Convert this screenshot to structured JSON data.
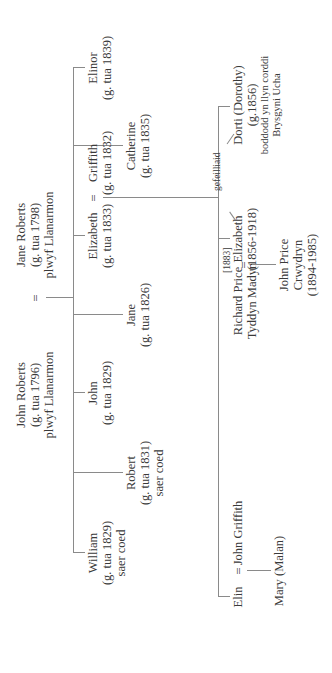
{
  "diagram": {
    "type": "family-tree",
    "orientation": "rotated-90-ccw",
    "marriage_symbol": "=",
    "line_color": "#8a8a8a",
    "text_color": "#3a3a3a"
  },
  "parents": {
    "father": {
      "name": "John Roberts",
      "born": "(g. tua 1796)",
      "place": "plwyf Llanarmon"
    },
    "mother": {
      "name": "Jane Roberts",
      "born": "(g. tua 1798)",
      "place": "plwyf Llanarmon"
    }
  },
  "children": [
    {
      "name": "William",
      "born": "(g. tua 1829)",
      "note": "saer coed"
    },
    {
      "name": "Robert",
      "born": "(g. tua 1831)",
      "note": "saer coed"
    },
    {
      "name": "John",
      "born": "(g. tua 1829)"
    },
    {
      "name": "Jane",
      "born": "(g. tua 1826)"
    },
    {
      "name": "Elizabeth",
      "born": "(g. tua 1833)"
    },
    {
      "name": "Catherine",
      "born": "(g. tua 1835)"
    },
    {
      "name": "Elinor",
      "born": "(g. tua 1839)"
    }
  ],
  "spouse_of_elizabeth": {
    "name": "Griffith",
    "born": "(g. tua 1832)"
  },
  "grandchildren": [
    {
      "name": "Elin",
      "spouse": "John Griffith",
      "child": "Mary (Malan)"
    },
    {
      "name": "Elizabeth",
      "born": "(1856-1918)",
      "spouse": "Richard Price",
      "spouse_place": "Tyddyn Madyn",
      "marriage_year": "[1883]",
      "child_name": "John Price",
      "child_line2": "Crwydryn",
      "child_dates": "(1894-1985)"
    },
    {
      "name": "Dorti (Dorothy)",
      "born": "(g.1856)",
      "note1": "boddodd yn llyn corddi",
      "note2": "Brysgyni Ucha"
    }
  ],
  "twins_label": "gefeilliaid"
}
